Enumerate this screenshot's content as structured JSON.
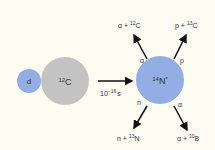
{
  "deuteron": {
    "label": "d"
  },
  "carbon": {
    "mass": "12",
    "symbol": "C"
  },
  "arrow": {
    "base": "10",
    "exp": "−16",
    "unit": "s"
  },
  "compound": {
    "mass": "14",
    "symbol": "N",
    "mark": "*"
  },
  "channels": [
    {
      "emit": "α",
      "prod_prefix": "α + ",
      "mass": "12",
      "symbol": "C"
    },
    {
      "emit": "p",
      "prod_prefix": "p + ",
      "mass": "13",
      "symbol": "C"
    },
    {
      "emit": "n",
      "prod_prefix": "n + ",
      "mass": "13",
      "symbol": "N"
    },
    {
      "emit": "α",
      "prod_prefix": "α + ",
      "mass": "10",
      "symbol": "B"
    }
  ],
  "colors": {
    "blue": "#92aee4",
    "gray": "#c3c3c3",
    "bg": "#fdfcf3"
  }
}
